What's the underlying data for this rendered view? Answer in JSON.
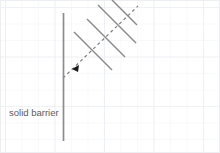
{
  "figure": {
    "title": "",
    "width": 220,
    "height": 153,
    "background_color": "#ffffff",
    "labels": {
      "barrier": "solid barrier"
    },
    "colors": {
      "grid_minor": "#f0f2f5",
      "grid_major": "#e6e9ef",
      "barrier_line": "#8c8c8c",
      "wavefront_line": "#8a8a8a",
      "ray_line": "#7d7d7d",
      "arrow_head": "#1a1a1a",
      "label_text": "#5a5a5a",
      "frame": "#e8eaee"
    },
    "grid": {
      "visible": true,
      "cell_size": 16.5,
      "origin_x": 5,
      "origin_y": 7,
      "major_every": 3
    },
    "barrier": {
      "name": "solid barrier",
      "orientation": "vertical",
      "x": 63,
      "y_top": 13,
      "y_bottom": 141,
      "stroke_width": 1.6
    },
    "ray": {
      "name": "incident-ray",
      "style": "dashed",
      "dash_pattern": "3 3",
      "x1": 63,
      "y1": 78,
      "x2": 137,
      "y2": 7,
      "stroke_width": 1.2,
      "direction": "down-left",
      "arrow": {
        "x": 75,
        "y": 66,
        "size": 4
      }
    },
    "wavefronts": [
      {
        "name": "wavefront-1",
        "x1": 74,
        "y1": 32,
        "x2": 112,
        "y2": 70
      },
      {
        "name": "wavefront-2",
        "x1": 87,
        "y1": 19,
        "x2": 125,
        "y2": 57
      },
      {
        "name": "wavefront-3",
        "x1": 98,
        "y1": 5,
        "x2": 136,
        "y2": 43
      },
      {
        "name": "wavefront-4",
        "x1": 111,
        "y1": 0,
        "x2": 136,
        "y2": 25
      }
    ]
  }
}
